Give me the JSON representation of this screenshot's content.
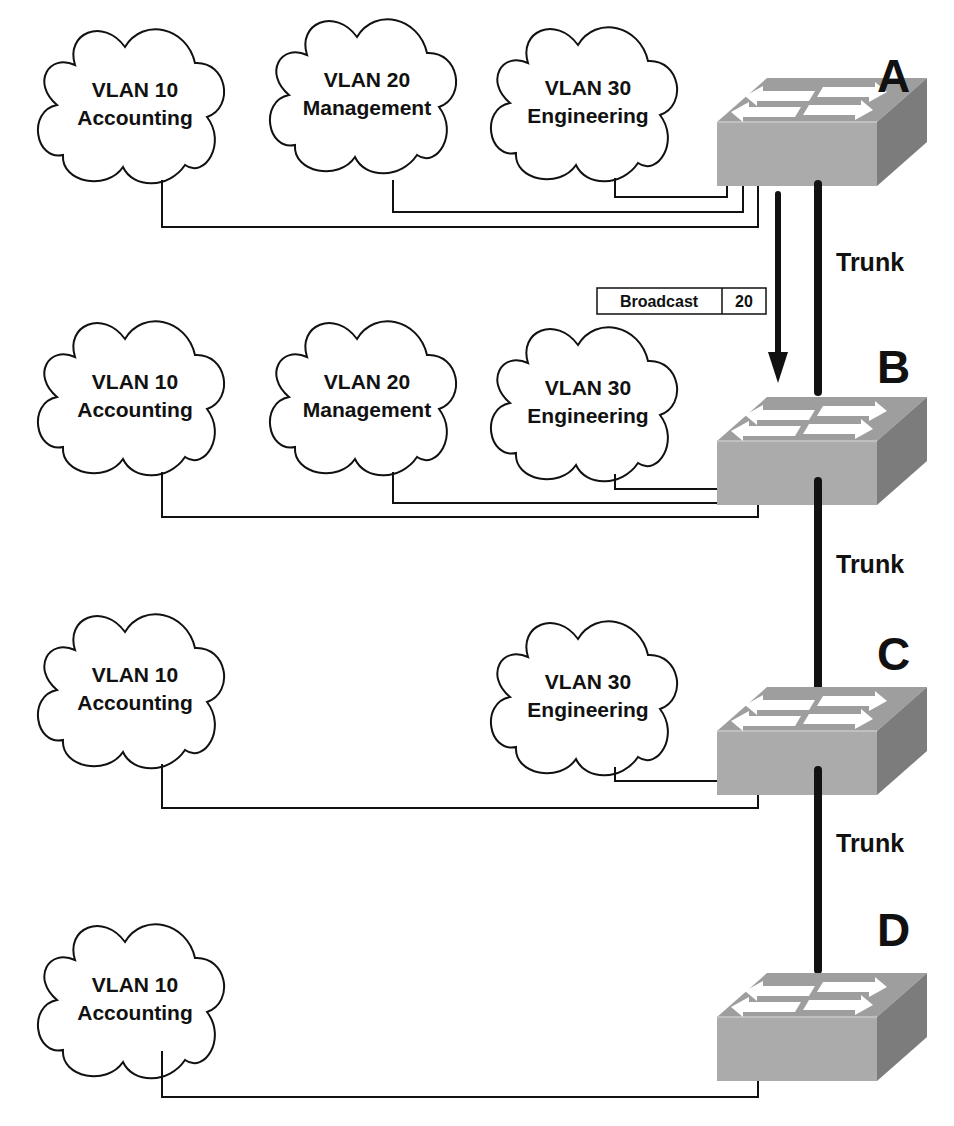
{
  "diagram": {
    "switches": [
      {
        "id": "A",
        "label": "A"
      },
      {
        "id": "B",
        "label": "B"
      },
      {
        "id": "C",
        "label": "C"
      },
      {
        "id": "D",
        "label": "D"
      }
    ],
    "rows": {
      "A": [
        {
          "vlan": "VLAN 10",
          "name": "Accounting"
        },
        {
          "vlan": "VLAN 20",
          "name": "Management"
        },
        {
          "vlan": "VLAN 30",
          "name": "Engineering"
        }
      ],
      "B": [
        {
          "vlan": "VLAN 10",
          "name": "Accounting"
        },
        {
          "vlan": "VLAN 20",
          "name": "Management"
        },
        {
          "vlan": "VLAN 30",
          "name": "Engineering"
        }
      ],
      "C": [
        {
          "vlan": "VLAN 10",
          "name": "Accounting"
        },
        {
          "vlan": "VLAN 30",
          "name": "Engineering"
        }
      ],
      "D": [
        {
          "vlan": "VLAN 10",
          "name": "Accounting"
        }
      ]
    },
    "trunks": [
      {
        "from": "A",
        "to": "B",
        "label": "Trunk"
      },
      {
        "from": "B",
        "to": "C",
        "label": "Trunk"
      },
      {
        "from": "C",
        "to": "D",
        "label": "Trunk"
      }
    ],
    "frame": {
      "type": "Broadcast",
      "vlan_tag": "20",
      "direction": "A to B"
    },
    "colors": {
      "switch_front": "#a9a9a9",
      "switch_top": "#9d9d9d",
      "switch_side": "#7a7a7a",
      "line": "#111111"
    }
  }
}
